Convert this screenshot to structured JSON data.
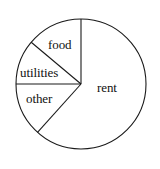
{
  "chart_data": {
    "type": "pie",
    "title": "",
    "subtitle": "",
    "xlabel": "",
    "ylabel": "",
    "legend_position": "none",
    "grid": false,
    "labels_inside": true,
    "center": {
      "x": 81,
      "y": 84
    },
    "radius": 65,
    "start_angle_deg": 90,
    "direction": "counterclockwise",
    "categories": [
      "rent",
      "food",
      "utilities",
      "other"
    ],
    "values": [
      61.7,
      13.9,
      11.1,
      13.3
    ],
    "units": "percent",
    "slices": [
      {
        "label": "rent",
        "value": 61.7,
        "angle_deg": 222,
        "start_angle_deg": 228,
        "end_angle_deg": 90,
        "fill": "#ffffff",
        "stroke": "#1a1a1a"
      },
      {
        "label": "food",
        "value": 13.9,
        "angle_deg": 50,
        "start_angle_deg": 90,
        "end_angle_deg": 140,
        "fill": "#ffffff",
        "stroke": "#1a1a1a"
      },
      {
        "label": "utilities",
        "value": 11.1,
        "angle_deg": 40,
        "start_angle_deg": 140,
        "end_angle_deg": 180,
        "fill": "#ffffff",
        "stroke": "#1a1a1a"
      },
      {
        "label": "other",
        "value": 13.3,
        "angle_deg": 48,
        "start_angle_deg": 180,
        "end_angle_deg": 228,
        "fill": "#ffffff",
        "stroke": "#1a1a1a"
      }
    ],
    "colors": {
      "background": "#ffffff",
      "outline": "#1a1a1a",
      "divider": "#1a1a1a",
      "label_text": "#111111"
    }
  },
  "labels": {
    "food": "food",
    "utilities": "utilities",
    "other": "other",
    "rent": "rent"
  }
}
